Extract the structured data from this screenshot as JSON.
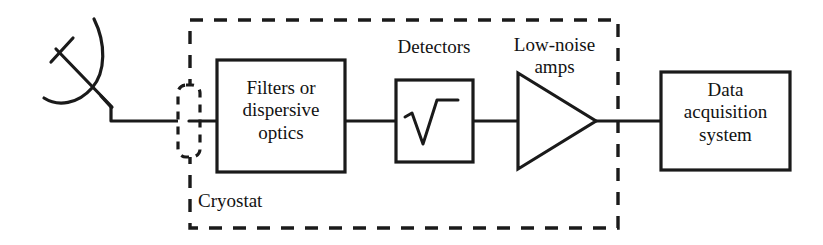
{
  "figure": {
    "type": "block-diagram",
    "background_color": "#ffffff",
    "line_color": "#1a1a1a"
  },
  "blocks": {
    "antenna": {
      "icon": "parabolic-dish-antenna-icon",
      "label": ""
    },
    "window": {
      "icon": "cryostat-window-icon",
      "label": "",
      "style": "dashed-rounded-rectangle"
    },
    "filters": {
      "label": "Filters or\ndispersive\noptics"
    },
    "detectors": {
      "label": "Detectors",
      "symbol": "√",
      "symbol_name": "square-root-icon"
    },
    "amplifier": {
      "label": "Low-noise\namps",
      "symbol_name": "amplifier-triangle-icon"
    },
    "data_acquisition": {
      "label": "Data\nacquisition\nsystem"
    }
  },
  "enclosure": {
    "label": "Cryostat",
    "style": "dashed-rectangle"
  },
  "connections": [
    {
      "from": "antenna",
      "to": "window"
    },
    {
      "from": "window",
      "to": "filters"
    },
    {
      "from": "filters",
      "to": "detectors"
    },
    {
      "from": "detectors",
      "to": "amplifier"
    },
    {
      "from": "amplifier",
      "to": "data_acquisition"
    }
  ]
}
